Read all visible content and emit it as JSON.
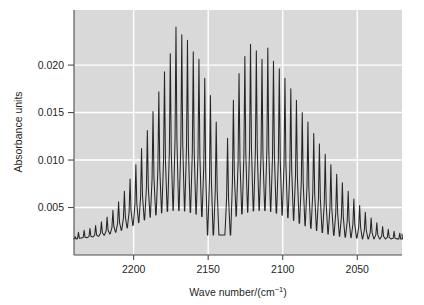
{
  "chart_data": {
    "type": "line",
    "title": "",
    "xlabel": "Wave number/(cm⁻¹)",
    "ylabel": "Absorbance units",
    "xlim": [
      2240,
      2020
    ],
    "ylim": [
      0.0,
      0.0258
    ],
    "x_inverted": true,
    "grid": true,
    "legend": null,
    "plot_background": "#d9d9d9",
    "gridline_color": "#ffffff",
    "trace_color": "#262626",
    "axis_color": "#4d4d4d",
    "xticks": [
      2200,
      2150,
      2100,
      2050
    ],
    "xtick_labels": [
      "2200",
      "2150",
      "2100",
      "2050"
    ],
    "yticks": [
      0.005,
      0.01,
      0.015,
      0.02
    ],
    "ytick_labels": [
      "0.005",
      "0.010",
      "0.015",
      "0.020"
    ],
    "baseline": 0.0017,
    "line_spacing_cm1": 3.86,
    "band_centre_cm1": 2143,
    "branches": [
      {
        "name": "R-branch",
        "peak_max_absorbance": 0.024,
        "peak_max_wavenumber": 2172,
        "lines": [
          {
            "x": 2237.0,
            "y": 0.0024
          },
          {
            "x": 2233.2,
            "y": 0.0026
          },
          {
            "x": 2229.3,
            "y": 0.0028
          },
          {
            "x": 2225.5,
            "y": 0.0031
          },
          {
            "x": 2221.6,
            "y": 0.0035
          },
          {
            "x": 2217.8,
            "y": 0.004
          },
          {
            "x": 2213.9,
            "y": 0.0047
          },
          {
            "x": 2210.1,
            "y": 0.0056
          },
          {
            "x": 2206.2,
            "y": 0.0067
          },
          {
            "x": 2202.4,
            "y": 0.008
          },
          {
            "x": 2198.5,
            "y": 0.0095
          },
          {
            "x": 2194.7,
            "y": 0.0112
          },
          {
            "x": 2190.8,
            "y": 0.0131
          },
          {
            "x": 2187.0,
            "y": 0.0151
          },
          {
            "x": 2183.1,
            "y": 0.0172
          },
          {
            "x": 2179.3,
            "y": 0.0193
          },
          {
            "x": 2175.4,
            "y": 0.0212
          },
          {
            "x": 2171.6,
            "y": 0.024
          },
          {
            "x": 2167.7,
            "y": 0.0232
          },
          {
            "x": 2163.9,
            "y": 0.0226
          },
          {
            "x": 2160.0,
            "y": 0.0214
          },
          {
            "x": 2156.2,
            "y": 0.0206
          },
          {
            "x": 2152.3,
            "y": 0.0186
          },
          {
            "x": 2148.5,
            "y": 0.0168
          },
          {
            "x": 2144.6,
            "y": 0.014
          }
        ]
      },
      {
        "name": "P-branch",
        "peak_max_absorbance": 0.0222,
        "peak_max_wavenumber": 2122,
        "lines": [
          {
            "x": 2137.0,
            "y": 0.0123
          },
          {
            "x": 2133.1,
            "y": 0.0163
          },
          {
            "x": 2129.3,
            "y": 0.0191
          },
          {
            "x": 2125.4,
            "y": 0.0209
          },
          {
            "x": 2121.6,
            "y": 0.0222
          },
          {
            "x": 2117.7,
            "y": 0.0215
          },
          {
            "x": 2113.9,
            "y": 0.0206
          },
          {
            "x": 2110.0,
            "y": 0.0218
          },
          {
            "x": 2106.2,
            "y": 0.0204
          },
          {
            "x": 2102.3,
            "y": 0.0196
          },
          {
            "x": 2098.5,
            "y": 0.0186
          },
          {
            "x": 2094.6,
            "y": 0.0175
          },
          {
            "x": 2090.8,
            "y": 0.0163
          },
          {
            "x": 2086.9,
            "y": 0.015
          },
          {
            "x": 2083.1,
            "y": 0.014
          },
          {
            "x": 2079.2,
            "y": 0.0128
          },
          {
            "x": 2075.4,
            "y": 0.0117
          },
          {
            "x": 2071.5,
            "y": 0.0106
          },
          {
            "x": 2067.7,
            "y": 0.0095
          },
          {
            "x": 2063.8,
            "y": 0.0085
          },
          {
            "x": 2060.0,
            "y": 0.0076
          },
          {
            "x": 2056.1,
            "y": 0.0067
          },
          {
            "x": 2052.3,
            "y": 0.0059
          },
          {
            "x": 2048.4,
            "y": 0.0052
          },
          {
            "x": 2044.6,
            "y": 0.0045
          },
          {
            "x": 2040.7,
            "y": 0.0039
          },
          {
            "x": 2036.9,
            "y": 0.0034
          },
          {
            "x": 2033.0,
            "y": 0.003
          },
          {
            "x": 2029.2,
            "y": 0.0027
          },
          {
            "x": 2025.3,
            "y": 0.0025
          },
          {
            "x": 2021.5,
            "y": 0.0023
          }
        ]
      }
    ]
  }
}
